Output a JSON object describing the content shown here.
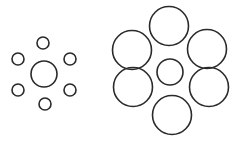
{
  "figure": {
    "title": "",
    "stroke_color": "#2a2a2a",
    "background": "#ffffff"
  },
  "left_group": {
    "center": {
      "cx": 44,
      "cy": 74,
      "r": 13
    },
    "satellites": [
      {
        "cx": 43,
        "cy": 43,
        "r": 6
      },
      {
        "cx": 18,
        "cy": 59,
        "r": 6
      },
      {
        "cx": 70,
        "cy": 59,
        "r": 6
      },
      {
        "cx": 18,
        "cy": 90,
        "r": 6
      },
      {
        "cx": 70,
        "cy": 90,
        "r": 6
      },
      {
        "cx": 45,
        "cy": 104,
        "r": 6
      }
    ]
  },
  "right_group": {
    "center": {
      "cx": 170,
      "cy": 72,
      "r": 13
    },
    "satellites": [
      {
        "cx": 169,
        "cy": 26,
        "r": 19.5
      },
      {
        "cx": 132,
        "cy": 50,
        "r": 19.5
      },
      {
        "cx": 207,
        "cy": 49,
        "r": 19.5
      },
      {
        "cx": 133,
        "cy": 87,
        "r": 19.5
      },
      {
        "cx": 209,
        "cy": 87,
        "r": 19.5
      },
      {
        "cx": 172,
        "cy": 115,
        "r": 19.5
      }
    ]
  }
}
